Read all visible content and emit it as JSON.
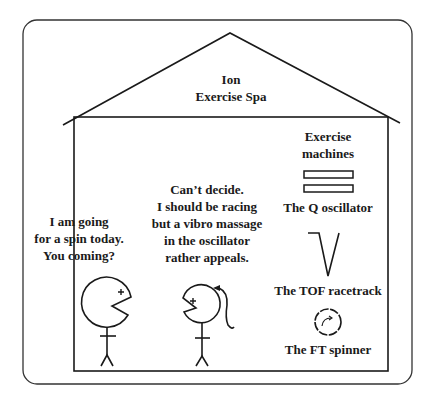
{
  "title": {
    "line1": "Ion",
    "line2": "Exercise Spa"
  },
  "machines_heading": {
    "line1": "Exercise",
    "line2": "machines"
  },
  "machines": [
    {
      "name": "The Q oscillator",
      "icon": "parallel-plates-icon"
    },
    {
      "name": "The TOF racetrack",
      "icon": "v-track-icon"
    },
    {
      "name": "The FT spinner",
      "icon": "circular-spinner-icon"
    }
  ],
  "speech": {
    "left": [
      "I am going",
      "for a spin today.",
      "You coming?"
    ],
    "right": [
      "Can’t decide.",
      "I should be racing",
      "but a vibro massage",
      "in the oscillator",
      "rather appeals."
    ]
  },
  "colors": {
    "stroke": "#1a1a1a",
    "background": "#ffffff"
  }
}
